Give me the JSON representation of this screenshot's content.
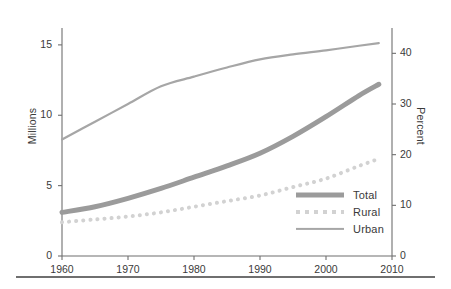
{
  "figure": {
    "background_color": "#ffffff",
    "rule_color": "#6f6f6f"
  },
  "axes": {
    "left": {
      "title": "Millions",
      "ticks": [
        "0",
        "5",
        "10",
        "15"
      ],
      "range": [
        0,
        16.2
      ]
    },
    "right": {
      "title": "Percent",
      "ticks": [
        "0",
        "10",
        "20",
        "30",
        "40"
      ],
      "range": [
        0,
        45
      ]
    },
    "bottom": {
      "title": "",
      "ticks": [
        "1960",
        "1970",
        "1980",
        "1990",
        "2000",
        "2010"
      ],
      "range": [
        1960,
        2010
      ]
    }
  },
  "legend": {
    "items": [
      {
        "label": "Total",
        "color": "#9b9b9b",
        "style": "solid-thick"
      },
      {
        "label": "Rural",
        "color": "#d2d2d2",
        "style": "dotted"
      },
      {
        "label": "Urban",
        "color": "#a6a6a6",
        "style": "solid-thin"
      }
    ]
  },
  "chart_data": {
    "type": "line",
    "title": "",
    "subtitle": "",
    "xlabel": "",
    "ylabel": "Millions",
    "y2label": "Percent",
    "xlim": [
      1960,
      2010
    ],
    "ylim": [
      0,
      16.2
    ],
    "y2lim": [
      0,
      45
    ],
    "grid": false,
    "legend_position": "bottom-right",
    "xticks": [
      1960,
      1970,
      1980,
      1990,
      2000,
      2010
    ],
    "yticks": [
      0,
      5,
      10,
      15
    ],
    "y2ticks": [
      0,
      10,
      20,
      30,
      40
    ],
    "x": [
      1960,
      1965,
      1970,
      1975,
      1980,
      1985,
      1990,
      1995,
      2000,
      2005,
      2008
    ],
    "series": [
      {
        "name": "Total",
        "axis": "left",
        "units": "Millions",
        "color": "#9b9b9b",
        "line_style": "solid",
        "line_width": 5,
        "values": [
          3.1,
          3.5,
          4.1,
          4.8,
          5.6,
          6.4,
          7.3,
          8.5,
          9.9,
          11.4,
          12.2
        ]
      },
      {
        "name": "Rural",
        "axis": "left",
        "units": "Millions",
        "color": "#d2d2d2",
        "line_style": "dotted",
        "line_width": 4,
        "values": [
          2.4,
          2.6,
          2.8,
          3.1,
          3.5,
          3.9,
          4.3,
          4.9,
          5.5,
          6.4,
          6.9
        ]
      },
      {
        "name": "Urban",
        "axis": "right",
        "units": "Percent",
        "color": "#a6a6a6",
        "line_style": "solid",
        "line_width": 2.2,
        "values": [
          23.0,
          26.5,
          30.0,
          33.5,
          35.4,
          37.2,
          38.8,
          39.8,
          40.6,
          41.5,
          42.0
        ]
      }
    ]
  }
}
